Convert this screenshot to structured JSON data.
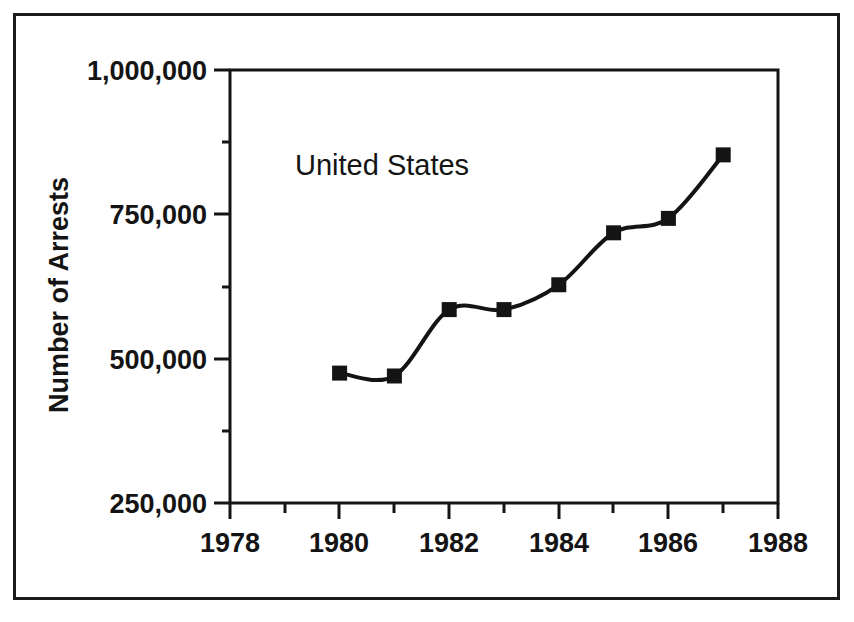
{
  "chart_data": {
    "type": "line",
    "title": "",
    "subtitle": "",
    "xlabel": "",
    "ylabel": "Number of Arrests",
    "x": [
      1980,
      1981,
      1982,
      1983,
      1984,
      1985,
      1986,
      1987
    ],
    "values": [
      475000,
      470000,
      585000,
      585000,
      628000,
      718000,
      743000,
      853000
    ],
    "series": [
      {
        "name": "United States",
        "x": [
          1980,
          1981,
          1982,
          1983,
          1984,
          1985,
          1986,
          1987
        ],
        "values": [
          475000,
          470000,
          585000,
          585000,
          628000,
          718000,
          743000,
          853000
        ]
      }
    ],
    "xlim": [
      1978,
      1988
    ],
    "ylim": [
      250000,
      1000000
    ],
    "xticks": [
      1978,
      1980,
      1982,
      1984,
      1986,
      1988
    ],
    "xtick_labels": [
      "1978",
      "1980",
      "1982",
      "1984",
      "1986",
      "1988"
    ],
    "xminor_ticks": [
      1979,
      1981,
      1983,
      1985,
      1987
    ],
    "yticks": [
      250000,
      500000,
      750000,
      1000000
    ],
    "ytick_labels": [
      "250,000",
      "500,000",
      "750,000",
      "1,000,000"
    ],
    "yminor_ticks": [
      375000,
      625000,
      875000
    ],
    "grid": false,
    "legend": "none",
    "annotations": [
      {
        "text": "United States",
        "x": 1980.1,
        "y": 900000
      }
    ],
    "marker": "square",
    "line_color": "#141414",
    "marker_color": "#141414",
    "background_color": "#ffffff",
    "axis_color": "#141414"
  },
  "figure": {
    "frame_label": "chart-outer-frame",
    "plot_area_label": "plot-area"
  }
}
